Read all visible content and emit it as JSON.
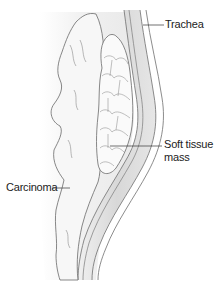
{
  "figure": {
    "labels": {
      "trachea": "Trachea",
      "soft_tissue_mass_line1": "Soft tissue",
      "soft_tissue_mass_line2": "mass",
      "carcinoma": "Carcinoma"
    },
    "colors": {
      "background": "#ffffff",
      "outline": "#6e6e6e",
      "tracheal_wall": "#dcdcdc",
      "shading": "#e8e8e8",
      "leader_line": "#333333",
      "text": "#222222"
    }
  }
}
